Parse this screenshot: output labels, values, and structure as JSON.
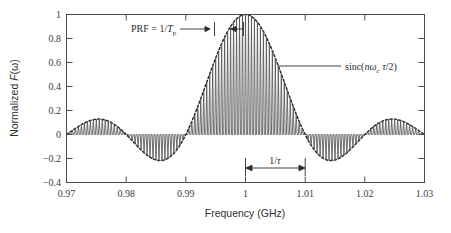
{
  "chart_data": {
    "type": "line",
    "title": "",
    "xlabel": "Frequency (GHz)",
    "ylabel": "Normalized F(ω)",
    "xlim": [
      0.97,
      1.03
    ],
    "ylim": [
      -0.4,
      1.0
    ],
    "grid": false,
    "legend": "none",
    "x_ticks": [
      "0.97",
      "0.98",
      "0.99",
      "1",
      "1.01",
      "1.02",
      "1.03"
    ],
    "x_tick_values": [
      0.97,
      0.98,
      0.99,
      1.0,
      1.01,
      1.02,
      1.03
    ],
    "y_ticks": [
      "1",
      "0.8",
      "0.6",
      "0.4",
      "0.2",
      "0",
      "−0.2",
      "−0.4"
    ],
    "y_tick_values": [
      1,
      0.8,
      0.6,
      0.4,
      0.2,
      0,
      -0.2,
      -0.4
    ],
    "series": [
      {
        "name": "pulse-train-spectrum",
        "style": "solid",
        "color": "#555555",
        "description": "Comb of spectral lines spaced by the PRF, amplitude modulated by a sinc envelope, centered at 1 GHz"
      },
      {
        "name": "sinc-envelope",
        "style": "dashed",
        "color": "#2a2a2a",
        "description": "sinc(nωc τ/2) envelope, first nulls at 0.99 and 1.01 GHz"
      }
    ],
    "center_frequency_ghz": 1.0,
    "peak_value": 1.0,
    "line_spacing_ghz": 0.0005,
    "main_lobe_null_left_ghz": 0.99,
    "main_lobe_null_right_ghz": 1.01,
    "sidelobe_peak_value": 0.13,
    "sidelobe_min_value": -0.22,
    "annotations": [
      {
        "name": "prf-annotation",
        "text_plain": "PRF = 1/Tp",
        "text_main": "PRF = 1/",
        "text_italic": "T",
        "text_sub": "p",
        "points_to_ghz": 0.9995
      },
      {
        "name": "sinc-annotation",
        "text_plain": "sinc(nωc τ/2)",
        "prefix": "sinc(",
        "italic_n": "n",
        "omega": "ω",
        "omega_sub": "c",
        "tau": "τ",
        "suffix": "/2)",
        "points_to_ghz": 1.0055
      },
      {
        "name": "tau-width-annotation",
        "text_plain": "1/τ",
        "numerator": "1/",
        "tau": "τ",
        "span_from_ghz": 1.0,
        "span_to_ghz": 1.01
      }
    ]
  },
  "axes": {
    "x_title": "Frequency (GHz)",
    "y_title_prefix": "Normalized ",
    "y_title_func": "F",
    "y_title_arg": "(ω)"
  },
  "colors": {
    "signal": "#555555",
    "envelope": "#2a2a2a",
    "frame": "#4d4d4d",
    "text": "#2b2b2b",
    "background": "#ffffff"
  }
}
